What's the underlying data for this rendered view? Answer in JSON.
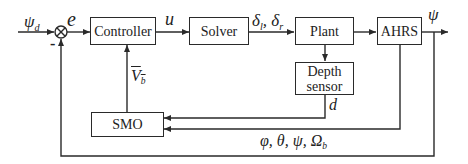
{
  "blocks": {
    "controller": "Controller",
    "solver": "Solver",
    "plant": "Plant",
    "ahrs": "AHRS",
    "depth_sensor": [
      "Depth",
      "sensor"
    ],
    "smo": "SMO"
  },
  "signals": {
    "reference": {
      "sym": "ψ",
      "sub": "d"
    },
    "error": "e",
    "control": "u",
    "deflections": {
      "a": "δ",
      "a_sub": "l",
      "sep": ", ",
      "b": "δ",
      "b_sub": "r"
    },
    "output": "ψ",
    "depth": "d",
    "velocity_est": {
      "sym": "V",
      "sub": "b"
    },
    "attitude": {
      "text": "φ, θ, ψ, Ω",
      "sub": "b"
    },
    "feedback_sign": "-"
  },
  "colors": {
    "line": "#2a2a2a",
    "background": "#ffffff"
  }
}
